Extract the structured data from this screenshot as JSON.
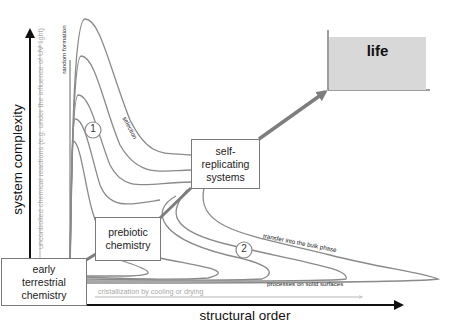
{
  "axes": {
    "y_label": "system complexity",
    "x_label": "structural order"
  },
  "side_arrows": {
    "vertical_label": "uncontrolled chemical reactions (e.g. under the influence of UV light)",
    "horizontal_label": "cristallization by  cooling or drying"
  },
  "curve_labels": {
    "random_formation": "random formation",
    "selection": "selection",
    "transfer_bulk": "transfer into the bulk phase",
    "solid_surfaces": "processes on solid surfaces"
  },
  "markers": {
    "one": "1",
    "two": "2"
  },
  "boxes": {
    "early": [
      "early",
      "terrestrial",
      "chemistry"
    ],
    "prebiotic": [
      "prebiotic",
      "chemistry"
    ],
    "self_replicating": [
      "self-",
      "replicating",
      "systems"
    ],
    "life": "life"
  },
  "colors": {
    "axis": "#111111",
    "curve": "#8a8a8a",
    "light_arrow": "#b5b5b5",
    "life_fill": "#d8d8d8",
    "connector": "#7d7d7d"
  }
}
